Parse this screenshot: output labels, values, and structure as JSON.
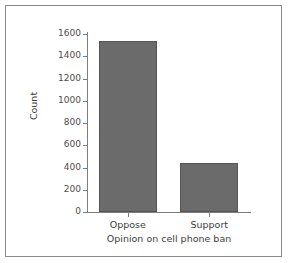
{
  "chart_data": {
    "type": "bar",
    "title": "",
    "xlabel": "Opinion on cell phone ban",
    "ylabel": "Count",
    "categories": [
      "Oppose",
      "Support"
    ],
    "values": [
      1540,
      440
    ],
    "ylim": [
      0,
      1600
    ],
    "yticks": [
      0,
      200,
      400,
      600,
      800,
      1000,
      1200,
      1400,
      1600
    ],
    "ytick_labels": [
      "0",
      "200",
      "400",
      "600",
      "800",
      "1000",
      "1200",
      "1400",
      "1600"
    ],
    "grid": false,
    "legend": null,
    "bar_color": "#6b6b6b",
    "bar_edge_color": "#555555",
    "axis_color": "#7d7d7d",
    "frame_color": "#8a8a8a",
    "background": "#ffffff"
  }
}
